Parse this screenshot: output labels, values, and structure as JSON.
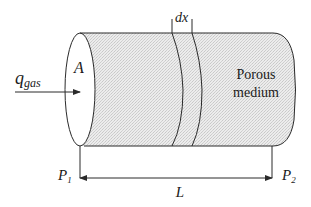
{
  "diagram": {
    "labels": {
      "flow_rate_main": "q",
      "flow_rate_sub": "gas",
      "area": "A",
      "slice": "dx",
      "medium_line1": "Porous",
      "medium_line2": "medium",
      "pressure_inlet_main": "P",
      "pressure_inlet_sub": "1",
      "pressure_outlet_main": "P",
      "pressure_outlet_sub": "2",
      "length": "L"
    },
    "colors": {
      "stroke": "#2a2a2a",
      "fill_stipple": "#e6e6e6",
      "background": "#ffffff"
    }
  }
}
